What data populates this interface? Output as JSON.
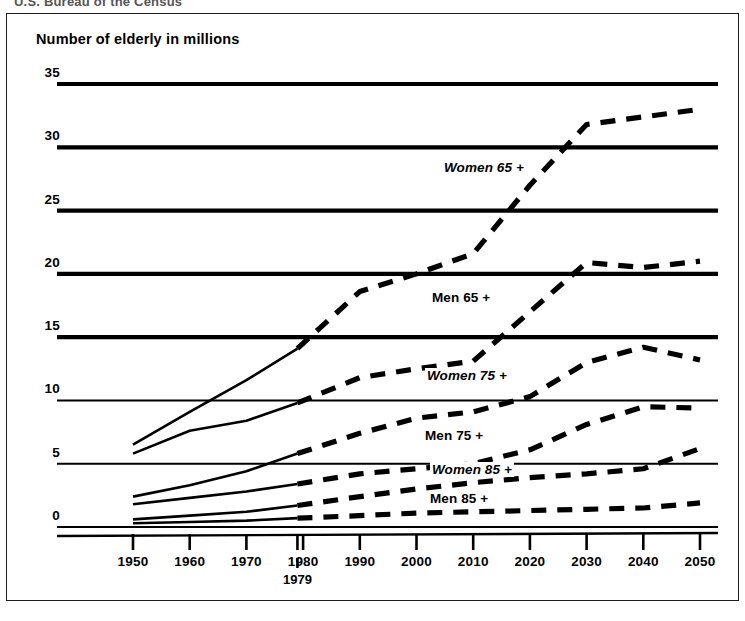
{
  "header": {
    "caption": "U.S. Bureau of the Census"
  },
  "chart_data": {
    "type": "line",
    "title": "Number of elderly in millions",
    "xlabel": "",
    "ylabel": "Number of elderly in millions",
    "ylim": [
      0,
      35
    ],
    "yticks": [
      0,
      5,
      10,
      15,
      20,
      25,
      30,
      35
    ],
    "xlim": [
      1950,
      2050
    ],
    "xticks": [
      1950,
      1960,
      1970,
      1980,
      1990,
      2000,
      2010,
      2020,
      2030,
      2040,
      2050
    ],
    "xtick_labels": [
      "1950",
      "1960",
      "1970",
      "1980",
      "1990",
      "2000",
      "2010",
      "2020",
      "2030",
      "2040",
      "2050"
    ],
    "special_marker": {
      "x": 1979,
      "label": "1979",
      "note": "divides historical (solid) from projected (dashed)"
    },
    "grid": true,
    "grid_axis": "y",
    "legend": "inline-labels",
    "line_color": "#000000",
    "historical_style": "solid",
    "projected_style": "dashed",
    "series": [
      {
        "name": "Women 65 +",
        "label_style": "italic",
        "historical_x": [
          1950,
          1960,
          1970,
          1979
        ],
        "historical_values": [
          6.5,
          9.1,
          11.6,
          14.1
        ],
        "projected_x": [
          1979,
          1990,
          2000,
          2010,
          2020,
          2030,
          2040,
          2050
        ],
        "projected_values": [
          14.1,
          18.6,
          20.0,
          21.6,
          27.0,
          31.8,
          32.4,
          33.0
        ]
      },
      {
        "name": "Men 65 +",
        "label_style": "regular",
        "historical_x": [
          1950,
          1960,
          1970,
          1979
        ],
        "historical_values": [
          5.8,
          7.6,
          8.4,
          9.8
        ],
        "projected_x": [
          1979,
          1990,
          2000,
          2010,
          2020,
          2030,
          2040,
          2050
        ],
        "projected_values": [
          9.8,
          11.8,
          12.5,
          13.1,
          17.0,
          20.9,
          20.5,
          21.0
        ]
      },
      {
        "name": "Women 75 +",
        "label_style": "italic",
        "historical_x": [
          1950,
          1960,
          1970,
          1979
        ],
        "historical_values": [
          2.4,
          3.3,
          4.4,
          5.8
        ],
        "projected_x": [
          1979,
          1990,
          2000,
          2010,
          2020,
          2030,
          2040,
          2050
        ],
        "projected_values": [
          5.8,
          7.4,
          8.6,
          9.1,
          10.3,
          13.0,
          14.2,
          13.2
        ]
      },
      {
        "name": "Men 75 +",
        "label_style": "regular",
        "historical_x": [
          1950,
          1960,
          1970,
          1979
        ],
        "historical_values": [
          1.8,
          2.3,
          2.8,
          3.4
        ],
        "projected_x": [
          1979,
          1990,
          2000,
          2010,
          2020,
          2030,
          2040,
          2050
        ],
        "projected_values": [
          3.4,
          4.2,
          4.6,
          5.0,
          6.1,
          8.1,
          9.5,
          9.4
        ]
      },
      {
        "name": "Women 85 +",
        "label_style": "italic",
        "historical_x": [
          1950,
          1960,
          1970,
          1979
        ],
        "historical_values": [
          0.6,
          0.9,
          1.2,
          1.7
        ],
        "projected_x": [
          1979,
          1990,
          2000,
          2010,
          2020,
          2030,
          2040,
          2050
        ],
        "projected_values": [
          1.7,
          2.4,
          3.0,
          3.5,
          3.9,
          4.2,
          4.6,
          6.2
        ]
      },
      {
        "name": "Men 85 +",
        "label_style": "regular",
        "historical_x": [
          1950,
          1960,
          1970,
          1979
        ],
        "historical_values": [
          0.3,
          0.4,
          0.5,
          0.7
        ],
        "projected_x": [
          1979,
          1990,
          2000,
          2010,
          2020,
          2030,
          2040,
          2050
        ],
        "projected_values": [
          0.7,
          0.9,
          1.1,
          1.2,
          1.3,
          1.4,
          1.5,
          1.9
        ]
      }
    ]
  }
}
